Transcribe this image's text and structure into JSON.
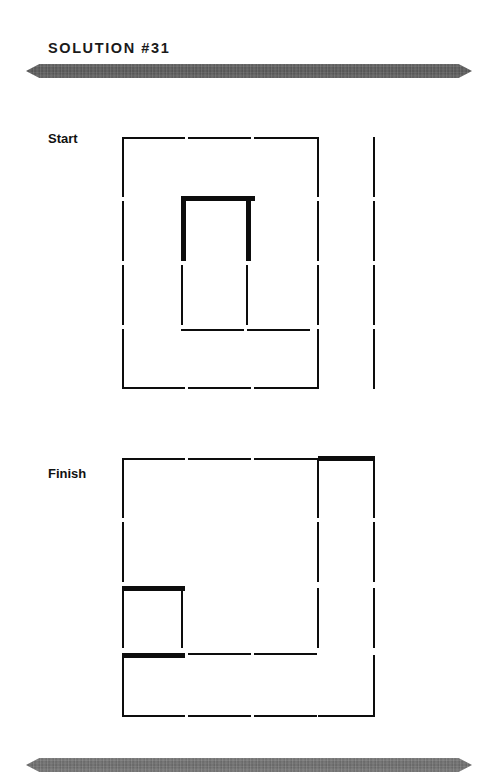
{
  "header": {
    "title": "SOLUTION #31"
  },
  "decor": {
    "top_rule": "ornamental-rule",
    "bottom_rule": "ornamental-rule",
    "rule_color": "#5a5a5a",
    "stick_color": "#0d0d0d"
  },
  "puzzle": {
    "type": "matchstick-puzzle",
    "grid_unit_px": 64,
    "panels": [
      {
        "id": "start",
        "label": "Start",
        "label_pos": {
          "x": 48,
          "y": 131
        },
        "origin": {
          "x": 122,
          "y": 137
        },
        "sticks": [
          {
            "id": "s1",
            "orient": "h",
            "x": 122,
            "y": 137,
            "len": 63,
            "bold": false
          },
          {
            "id": "s2",
            "orient": "h",
            "x": 188,
            "y": 137,
            "len": 63,
            "bold": false
          },
          {
            "id": "s3",
            "orient": "h",
            "x": 254,
            "y": 137,
            "len": 63,
            "bold": false
          },
          {
            "id": "s4",
            "orient": "v",
            "x": 122,
            "y": 137,
            "len": 60,
            "bold": false
          },
          {
            "id": "s5",
            "orient": "v",
            "x": 122,
            "y": 201,
            "len": 60,
            "bold": false
          },
          {
            "id": "s6",
            "orient": "v",
            "x": 122,
            "y": 265,
            "len": 60,
            "bold": false
          },
          {
            "id": "s7",
            "orient": "v",
            "x": 122,
            "y": 329,
            "len": 60,
            "bold": false
          },
          {
            "id": "s8",
            "orient": "v",
            "x": 317,
            "y": 137,
            "len": 60,
            "bold": false
          },
          {
            "id": "s9",
            "orient": "v",
            "x": 317,
            "y": 201,
            "len": 60,
            "bold": false
          },
          {
            "id": "s10",
            "orient": "v",
            "x": 317,
            "y": 265,
            "len": 60,
            "bold": false
          },
          {
            "id": "s11",
            "orient": "v",
            "x": 317,
            "y": 329,
            "len": 60,
            "bold": false
          },
          {
            "id": "s12",
            "orient": "h",
            "x": 122,
            "y": 387,
            "len": 63,
            "bold": false
          },
          {
            "id": "s13",
            "orient": "h",
            "x": 188,
            "y": 387,
            "len": 63,
            "bold": false
          },
          {
            "id": "s14",
            "orient": "h",
            "x": 254,
            "y": 387,
            "len": 63,
            "bold": false
          },
          {
            "id": "s15",
            "orient": "v",
            "x": 373,
            "y": 137,
            "len": 60,
            "bold": false
          },
          {
            "id": "s16",
            "orient": "v",
            "x": 373,
            "y": 201,
            "len": 60,
            "bold": false
          },
          {
            "id": "s17",
            "orient": "v",
            "x": 373,
            "y": 265,
            "len": 60,
            "bold": false
          },
          {
            "id": "s18",
            "orient": "v",
            "x": 373,
            "y": 329,
            "len": 60,
            "bold": false
          },
          {
            "id": "s19",
            "orient": "h",
            "x": 181,
            "y": 196,
            "len": 74,
            "bold": true
          },
          {
            "id": "s20",
            "orient": "v",
            "x": 181,
            "y": 201,
            "len": 60,
            "bold": true
          },
          {
            "id": "s21",
            "orient": "v",
            "x": 246,
            "y": 201,
            "len": 60,
            "bold": true
          },
          {
            "id": "s22",
            "orient": "v",
            "x": 181,
            "y": 265,
            "len": 60,
            "bold": false
          },
          {
            "id": "s23",
            "orient": "v",
            "x": 246,
            "y": 265,
            "len": 60,
            "bold": false
          },
          {
            "id": "s24",
            "orient": "h",
            "x": 181,
            "y": 329,
            "len": 63,
            "bold": false
          },
          {
            "id": "s25",
            "orient": "h",
            "x": 247,
            "y": 329,
            "len": 63,
            "bold": false
          }
        ]
      },
      {
        "id": "finish",
        "label": "Finish",
        "label_pos": {
          "x": 48,
          "y": 466
        },
        "origin": {
          "x": 122,
          "y": 458
        },
        "sticks": [
          {
            "id": "f1",
            "orient": "h",
            "x": 122,
            "y": 458,
            "len": 63,
            "bold": false
          },
          {
            "id": "f2",
            "orient": "h",
            "x": 188,
            "y": 458,
            "len": 63,
            "bold": false
          },
          {
            "id": "f3",
            "orient": "h",
            "x": 254,
            "y": 458,
            "len": 63,
            "bold": false
          },
          {
            "id": "f4",
            "orient": "h",
            "x": 318,
            "y": 456,
            "len": 57,
            "bold": true
          },
          {
            "id": "f5",
            "orient": "v",
            "x": 122,
            "y": 458,
            "len": 60,
            "bold": false
          },
          {
            "id": "f6",
            "orient": "v",
            "x": 122,
            "y": 522,
            "len": 60,
            "bold": false
          },
          {
            "id": "f7",
            "orient": "v",
            "x": 122,
            "y": 588,
            "len": 60,
            "bold": false
          },
          {
            "id": "f8",
            "orient": "v",
            "x": 122,
            "y": 655,
            "len": 60,
            "bold": false
          },
          {
            "id": "f9",
            "orient": "v",
            "x": 317,
            "y": 458,
            "len": 60,
            "bold": false
          },
          {
            "id": "f10",
            "orient": "v",
            "x": 317,
            "y": 522,
            "len": 60,
            "bold": false
          },
          {
            "id": "f11",
            "orient": "v",
            "x": 317,
            "y": 588,
            "len": 60,
            "bold": false
          },
          {
            "id": "f12",
            "orient": "v",
            "x": 373,
            "y": 458,
            "len": 60,
            "bold": false
          },
          {
            "id": "f13",
            "orient": "v",
            "x": 373,
            "y": 522,
            "len": 60,
            "bold": false
          },
          {
            "id": "f14",
            "orient": "v",
            "x": 373,
            "y": 588,
            "len": 60,
            "bold": false
          },
          {
            "id": "f15",
            "orient": "v",
            "x": 373,
            "y": 655,
            "len": 60,
            "bold": false
          },
          {
            "id": "f16",
            "orient": "h",
            "x": 122,
            "y": 586,
            "len": 63,
            "bold": true
          },
          {
            "id": "f17",
            "orient": "h",
            "x": 122,
            "y": 653,
            "len": 63,
            "bold": true
          },
          {
            "id": "f18",
            "orient": "h",
            "x": 188,
            "y": 653,
            "len": 63,
            "bold": false
          },
          {
            "id": "f19",
            "orient": "h",
            "x": 254,
            "y": 653,
            "len": 63,
            "bold": false
          },
          {
            "id": "f20",
            "orient": "v",
            "x": 181,
            "y": 588,
            "len": 60,
            "bold": false
          },
          {
            "id": "f21",
            "orient": "h",
            "x": 122,
            "y": 715,
            "len": 63,
            "bold": false
          },
          {
            "id": "f22",
            "orient": "h",
            "x": 188,
            "y": 715,
            "len": 63,
            "bold": false
          },
          {
            "id": "f23",
            "orient": "h",
            "x": 254,
            "y": 715,
            "len": 63,
            "bold": false
          },
          {
            "id": "f24",
            "orient": "h",
            "x": 318,
            "y": 715,
            "len": 57,
            "bold": false
          }
        ]
      }
    ]
  }
}
